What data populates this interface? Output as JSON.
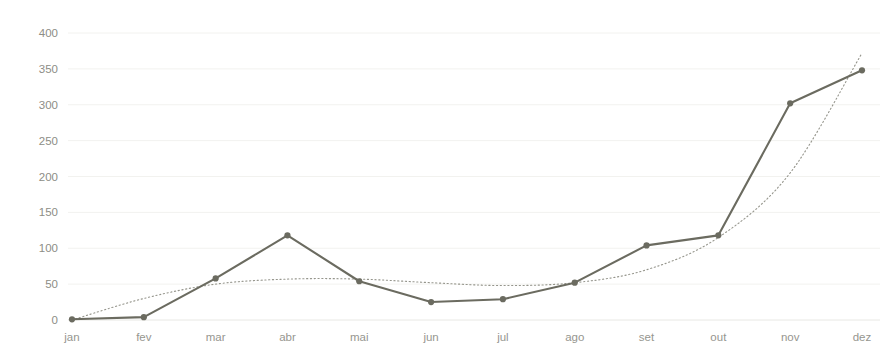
{
  "chart_data": {
    "type": "line",
    "title": "",
    "subtitle": "",
    "xlabel": "",
    "ylabel": "",
    "categories": [
      "jan",
      "fev",
      "mar",
      "abr",
      "mai",
      "jun",
      "jul",
      "ago",
      "set",
      "out",
      "nov",
      "dez"
    ],
    "series": [
      {
        "name": "série",
        "values": [
          1,
          4,
          58,
          118,
          54,
          25,
          29,
          52,
          104,
          118,
          302,
          348
        ],
        "color": "#6b6b60",
        "style": "solid",
        "markers": true
      },
      {
        "name": "linha de tendência",
        "values": [
          0,
          30,
          50,
          57,
          57,
          52,
          48,
          52,
          70,
          115,
          205,
          372
        ],
        "color": "#8a8a80",
        "style": "dotted",
        "markers": false
      }
    ],
    "ylim": [
      0,
      400
    ],
    "yticks": [
      0,
      50,
      100,
      150,
      200,
      250,
      300,
      350,
      400
    ],
    "ytick_labels": [
      "0",
      "50",
      "100",
      "150",
      "200",
      "250",
      "300",
      "350",
      "400"
    ],
    "xtick_labels": [
      "jan",
      "fev",
      "mar",
      "abr",
      "mai",
      "jun",
      "jul",
      "ago",
      "set",
      "out",
      "nov",
      "dez"
    ],
    "grid": true,
    "grid_color": "#f2f2ef",
    "legend": false,
    "legend_position": "none",
    "background": "#ffffff",
    "annotations": []
  },
  "axes": {
    "plot_left": 72,
    "plot_right": 862,
    "plot_top": 33,
    "plot_bottom": 320
  }
}
